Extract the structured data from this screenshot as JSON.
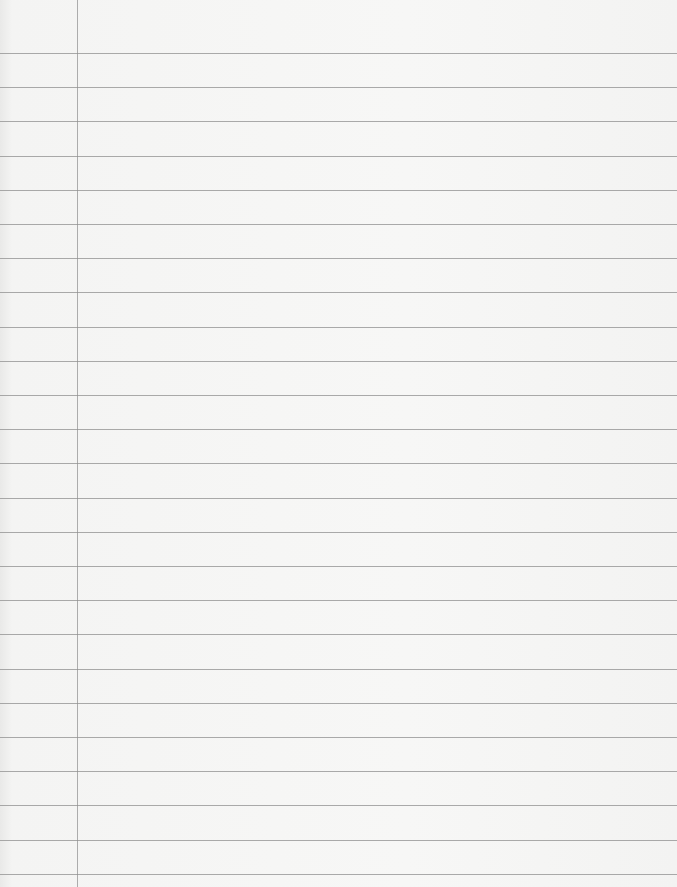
{
  "page": {
    "type": "lined-paper",
    "background_color": "#f6f6f5",
    "rule_color": "#8f8f8f",
    "margin_line_color": "#9a9a9a",
    "margin_x": 77,
    "first_rule_y": 53,
    "rule_spacing": 34.2,
    "rule_count": 25
  }
}
